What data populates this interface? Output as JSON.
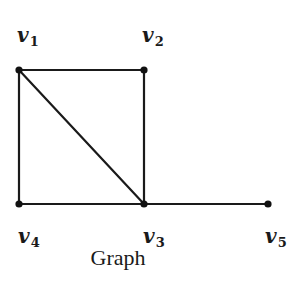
{
  "diagram": {
    "type": "undirected-graph",
    "caption": "Graph",
    "vertices": [
      {
        "id": "v1",
        "letter": "v",
        "sub": "1",
        "x": 19,
        "y": 70,
        "label_x": 17,
        "label_y": 42
      },
      {
        "id": "v2",
        "letter": "v",
        "sub": "2",
        "x": 144,
        "y": 70,
        "label_x": 142,
        "label_y": 42
      },
      {
        "id": "v3",
        "letter": "v",
        "sub": "3",
        "x": 144,
        "y": 204,
        "label_x": 143,
        "label_y": 243
      },
      {
        "id": "v4",
        "letter": "v",
        "sub": "4",
        "x": 19,
        "y": 204,
        "label_x": 18,
        "label_y": 243
      },
      {
        "id": "v5",
        "letter": "v",
        "sub": "5",
        "x": 268,
        "y": 204,
        "label_x": 265,
        "label_y": 243
      }
    ],
    "edges": [
      {
        "from": "v1",
        "to": "v2"
      },
      {
        "from": "v2",
        "to": "v3"
      },
      {
        "from": "v3",
        "to": "v4"
      },
      {
        "from": "v4",
        "to": "v1"
      },
      {
        "from": "v1",
        "to": "v3"
      },
      {
        "from": "v3",
        "to": "v5"
      }
    ],
    "colors": {
      "stroke": "#1a1a1a",
      "vertex": "#111111",
      "background": "#ffffff"
    }
  }
}
